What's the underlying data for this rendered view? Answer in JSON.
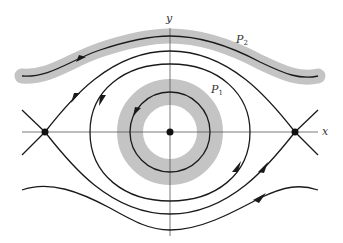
{
  "diagram": {
    "type": "phase-portrait",
    "axes": {
      "x_label": "x",
      "y_label": "y"
    },
    "regions": [
      {
        "id": "P1",
        "label_main": "P",
        "label_sub": "1",
        "shape": "annulus around center equilibrium"
      },
      {
        "id": "P2",
        "label_main": "P",
        "label_sub": "2",
        "shape": "band around wavy trajectory above separatrix"
      }
    ],
    "equilibria": [
      {
        "type": "center",
        "position": "origin"
      },
      {
        "type": "saddle",
        "position": "left on x-axis"
      },
      {
        "type": "saddle",
        "position": "right on x-axis"
      }
    ],
    "colors": {
      "band": "#c4c4c4",
      "trajectory": "#1a1a1a",
      "axis": "#555555",
      "background": "#ffffff"
    }
  }
}
